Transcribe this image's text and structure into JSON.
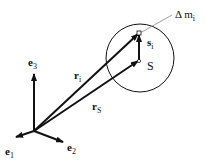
{
  "diagram": {
    "colors": {
      "stroke": "#111111",
      "leader": "#888888",
      "background": "#ffffff"
    },
    "origin": {
      "x": 34,
      "y": 131
    },
    "basis": [
      {
        "id": "e1",
        "symbol": "e",
        "subscript": "1",
        "tip": {
          "x": 16,
          "y": 137
        },
        "label_pos": {
          "x": 5,
          "y": 155
        }
      },
      {
        "id": "e2",
        "symbol": "e",
        "subscript": "2",
        "tip": {
          "x": 63,
          "y": 142
        },
        "label_pos": {
          "x": 67,
          "y": 151
        }
      },
      {
        "id": "e3",
        "symbol": "e",
        "subscript": "3",
        "tip": {
          "x": 34,
          "y": 73
        },
        "label_pos": {
          "x": 28,
          "y": 66
        }
      }
    ],
    "body": {
      "shape": "circle",
      "center": {
        "x": 140,
        "y": 58
      },
      "radius": 34
    },
    "points": [
      {
        "id": "mass-element",
        "x": 139,
        "y": 33
      },
      {
        "id": "center-of-mass",
        "x": 139,
        "y": 61
      }
    ],
    "vectors": [
      {
        "id": "r_i",
        "symbol": "r",
        "subscript": "i",
        "from": "origin",
        "to": "mass-element",
        "label_pos": {
          "x": 74,
          "y": 79
        }
      },
      {
        "id": "r_S",
        "symbol": "r",
        "subscript": "S",
        "from": "origin",
        "to": "center-of-mass",
        "label_pos": {
          "x": 92,
          "y": 110
        }
      },
      {
        "id": "s_i",
        "symbol": "s",
        "subscript": "i",
        "from": "center-of-mass",
        "to": "mass-element",
        "label_pos": {
          "x": 147,
          "y": 46
        }
      }
    ],
    "labels": {
      "S": {
        "text": "S",
        "x": 147,
        "y": 70
      },
      "delta_m": {
        "prefix": "Δ m",
        "subscript": "i",
        "x": 175,
        "y": 18
      }
    },
    "leader_line": {
      "from": {
        "x": 140,
        "y": 33
      },
      "to": {
        "x": 172,
        "y": 15
      }
    }
  }
}
